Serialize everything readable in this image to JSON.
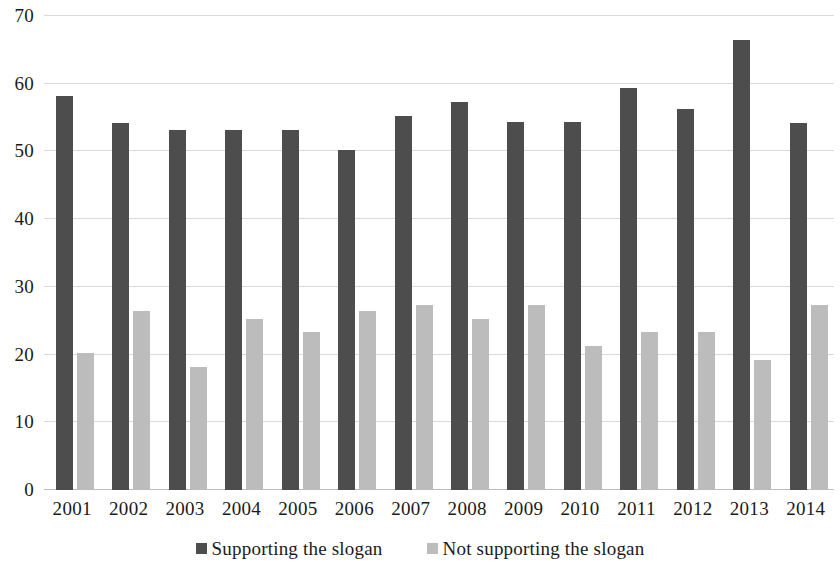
{
  "chart_data": {
    "type": "bar",
    "title": "",
    "subtitle": "",
    "xlabel": "",
    "ylabel": "",
    "ylim": [
      0,
      70
    ],
    "ytick_step": 10,
    "yticks": [
      70,
      60,
      50,
      40,
      30,
      20,
      10,
      0
    ],
    "ytick_labels": [
      "70",
      "60",
      "50",
      "40",
      "30",
      "20",
      "10",
      "0"
    ],
    "grid": true,
    "grid_axis": "y",
    "legend_position": "bottom-center",
    "categories": [
      "2001",
      "2002",
      "2003",
      "2004",
      "2005",
      "2006",
      "2007",
      "2008",
      "2009",
      "2010",
      "2011",
      "2012",
      "2013",
      "2014"
    ],
    "series": [
      {
        "name": "Supporting the slogan",
        "color": "#4d4d4d",
        "values": [
          58.2,
          54.2,
          53.2,
          53.2,
          53.2,
          50.2,
          55.3,
          57.3,
          54.3,
          54.3,
          59.3,
          56.2,
          66.5,
          54.2
        ]
      },
      {
        "name": "Not supporting the slogan",
        "color": "#bcbcbc",
        "values": [
          20.2,
          26.4,
          18.2,
          25.2,
          23.3,
          26.4,
          27.3,
          25.2,
          27.3,
          21.3,
          23.3,
          23.3,
          19.2,
          27.3
        ]
      }
    ]
  },
  "legend": {
    "items": [
      {
        "label": "Supporting the slogan",
        "color": "#4d4d4d"
      },
      {
        "label": "Not supporting the slogan",
        "color": "#bcbcbc"
      }
    ]
  },
  "colors": {
    "supporting": "#4d4d4d",
    "not_supporting": "#bcbcbc",
    "gridline": "#d9d9d9",
    "axis": "#bdbdbd",
    "text": "#1a1a1a",
    "background": "#ffffff"
  }
}
